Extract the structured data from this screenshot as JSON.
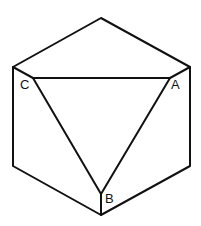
{
  "diagram": {
    "outline": {
      "top": [
        101,
        18
      ],
      "top_left": [
        13,
        67
      ],
      "top_right": [
        190,
        67
      ],
      "bottom_left": [
        13,
        166
      ],
      "bottom_right": [
        190,
        166
      ],
      "bottom": [
        101,
        215
      ]
    },
    "inner_vertices": {
      "C": [
        33,
        78
      ],
      "A": [
        170,
        78
      ],
      "B": [
        101,
        194
      ]
    },
    "labels": {
      "A": "A",
      "B": "B",
      "C": "C"
    },
    "stroke_color": "#111111",
    "background": "#ffffff"
  }
}
